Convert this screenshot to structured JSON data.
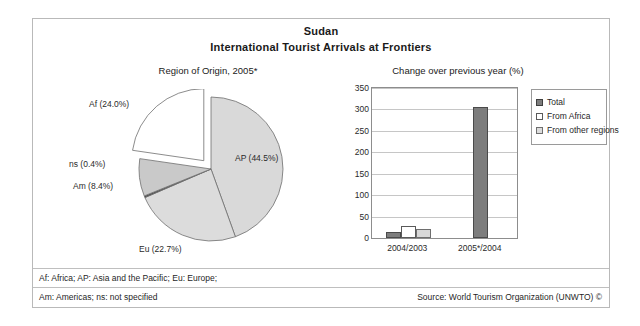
{
  "header": {
    "title": "Sudan",
    "subtitle": "International Tourist Arrivals at Frontiers"
  },
  "footer": {
    "note_line1": "Af: Africa; AP: Asia and the Pacific; Eu: Europe;",
    "note_line2": "Am: Americas; ns: not specified",
    "source": "Source: World Tourism Organization (UNWTO) ©"
  },
  "colors": {
    "border": "#b9b9b9",
    "pie_ap": "#d9d9d9",
    "pie_af": "#dcdcdc",
    "pie_am": "#c9c9c9",
    "pie_eu": "#ffffff",
    "pie_ns": "#4f4f4f",
    "bar_total": "#7d7d7d",
    "bar_africa": "#ffffff",
    "bar_other": "#d8d8d8"
  },
  "chart_data": [
    {
      "type": "pie",
      "title": "Region of Origin, 2005*",
      "labels": [
        "AP (44.5%)",
        "Af (24.0%)",
        "ns (0.4%)",
        "Am (8.4%)",
        "Eu (22.7%)"
      ],
      "categories": [
        "AP",
        "Af",
        "ns",
        "Am",
        "Eu"
      ],
      "values": [
        44.5,
        24.0,
        0.4,
        8.4,
        22.7
      ],
      "units": "percent",
      "exploded": [
        "Eu"
      ],
      "legend": "none"
    },
    {
      "type": "bar",
      "title": "Change over previous year (%)",
      "categories": [
        "2004/2003",
        "2005*/2004"
      ],
      "series": [
        {
          "name": "Total",
          "values": [
            15,
            305
          ]
        },
        {
          "name": "From Africa",
          "values": [
            29,
            null
          ]
        },
        {
          "name": "From other regions",
          "values": [
            21,
            null
          ]
        }
      ],
      "xlabel": "",
      "ylabel": "",
      "ylim": [
        0,
        350
      ],
      "yticks": [
        0,
        50,
        100,
        150,
        200,
        250,
        300,
        350
      ],
      "grid": true,
      "legend_position": "right"
    }
  ]
}
